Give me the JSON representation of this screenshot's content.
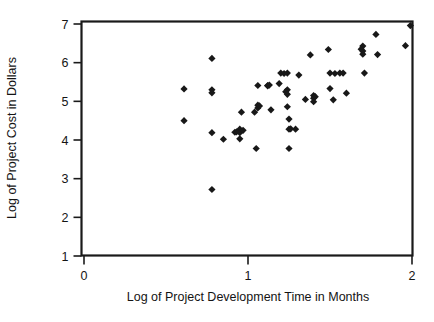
{
  "chart_data": {
    "type": "scatter",
    "title": "",
    "xlabel": "Log of Project Development Time in Months",
    "ylabel": "Log of Project Cost in Dollars",
    "xlim": [
      0,
      2
    ],
    "ylim": [
      1,
      7
    ],
    "xticks": [
      0,
      1,
      2
    ],
    "xticklabels": [
      "0",
      "1",
      "2"
    ],
    "yticks": [
      1,
      2,
      3,
      4,
      5,
      6,
      7
    ],
    "yticklabels": [
      "1",
      "2",
      "3",
      "4",
      "5",
      "6",
      "7"
    ],
    "grid": false,
    "legend": null,
    "marker": "diamond",
    "marker_color": "#181818",
    "frame": true,
    "n_points": 62,
    "points": [
      [
        0.61,
        5.32
      ],
      [
        0.61,
        4.5
      ],
      [
        0.78,
        6.11
      ],
      [
        0.78,
        5.3
      ],
      [
        0.78,
        5.22
      ],
      [
        0.78,
        4.19
      ],
      [
        0.78,
        2.72
      ],
      [
        0.85,
        4.02
      ],
      [
        0.92,
        4.2
      ],
      [
        0.95,
        4.28
      ],
      [
        0.95,
        4.19
      ],
      [
        0.95,
        4.03
      ],
      [
        0.96,
        4.72
      ],
      [
        1.04,
        4.72
      ],
      [
        1.05,
        3.78
      ],
      [
        1.06,
        5.41
      ],
      [
        1.06,
        4.9
      ],
      [
        1.06,
        4.83
      ],
      [
        1.12,
        5.41
      ],
      [
        1.14,
        4.78
      ],
      [
        1.19,
        5.46
      ],
      [
        1.2,
        5.73
      ],
      [
        1.24,
        5.73
      ],
      [
        1.24,
        5.3
      ],
      [
        1.24,
        5.18
      ],
      [
        1.24,
        4.86
      ],
      [
        1.25,
        4.54
      ],
      [
        1.25,
        4.28
      ],
      [
        1.25,
        3.78
      ],
      [
        1.29,
        4.28
      ],
      [
        1.31,
        5.68
      ],
      [
        1.38,
        6.2
      ],
      [
        1.4,
        5.15
      ],
      [
        1.4,
        5.08
      ],
      [
        1.4,
        4.99
      ],
      [
        1.49,
        6.34
      ],
      [
        1.5,
        5.73
      ],
      [
        1.5,
        5.33
      ],
      [
        1.52,
        5.04
      ],
      [
        1.56,
        5.73
      ],
      [
        1.58,
        5.73
      ],
      [
        1.6,
        5.21
      ],
      [
        1.7,
        6.43
      ],
      [
        1.7,
        6.3
      ],
      [
        1.7,
        6.22
      ],
      [
        1.71,
        5.73
      ],
      [
        1.78,
        6.73
      ],
      [
        1.79,
        6.21
      ],
      [
        1.96,
        6.44
      ],
      [
        1.99,
        6.96
      ],
      [
        1.12,
        5.4
      ],
      [
        1.23,
        5.25
      ],
      [
        1.35,
        5.05
      ],
      [
        0.97,
        4.25
      ],
      [
        1.07,
        4.88
      ],
      [
        1.22,
        5.72
      ],
      [
        1.41,
        5.12
      ],
      [
        1.53,
        5.72
      ],
      [
        1.69,
        6.35
      ],
      [
        1.26,
        4.29
      ],
      [
        0.93,
        4.21
      ],
      [
        1.13,
        5.42
      ]
    ]
  }
}
